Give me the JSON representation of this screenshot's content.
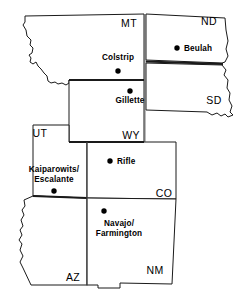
{
  "figure": {
    "name": "western-us-energy-sites-map",
    "type": "line-drawing-map",
    "background_color": "#ffffff",
    "line_color": "#1a1a1a",
    "width": 249,
    "height": 300
  },
  "states": [
    {
      "id": "MT",
      "abbr": "MT",
      "label_x": 129,
      "label_y": 27
    },
    {
      "id": "ND",
      "abbr": "ND",
      "label_x": 209,
      "label_y": 25
    },
    {
      "id": "SD",
      "abbr": "SD",
      "label_x": 214,
      "label_y": 104
    },
    {
      "id": "WY",
      "abbr": "WY",
      "label_x": 131,
      "label_y": 139
    },
    {
      "id": "UT",
      "abbr": "UT",
      "label_x": 40,
      "label_y": 137
    },
    {
      "id": "CO",
      "abbr": "CO",
      "label_x": 164,
      "label_y": 197
    },
    {
      "id": "AZ",
      "abbr": "AZ",
      "label_x": 73,
      "label_y": 281
    },
    {
      "id": "NM",
      "abbr": "NM",
      "label_x": 155,
      "label_y": 274
    }
  ],
  "sites": [
    {
      "id": "colstrip",
      "name": "Colstrip",
      "lines": [
        "Colstrip"
      ],
      "state": "MT",
      "dot_x": 118,
      "dot_y": 71,
      "label_x": 118,
      "label_y": 60,
      "label_anchor": "middle",
      "label_placement": "above"
    },
    {
      "id": "beulah",
      "name": "Beulah",
      "lines": [
        "Beulah"
      ],
      "state": "ND",
      "dot_x": 177,
      "dot_y": 48,
      "label_x": 184,
      "label_y": 51,
      "label_anchor": "start",
      "label_placement": "right"
    },
    {
      "id": "gillette",
      "name": "Gillette",
      "lines": [
        "Gillette"
      ],
      "state": "WY",
      "dot_x": 130,
      "dot_y": 91,
      "label_x": 130,
      "label_y": 103,
      "label_anchor": "middle",
      "label_placement": "below"
    },
    {
      "id": "kaiparowits-escalante",
      "name": "Kaiparowits/ Escalante",
      "lines": [
        "Kaiparowits/",
        "Escalante"
      ],
      "state": "UT",
      "dot_x": 54,
      "dot_y": 191,
      "label_x": 54,
      "label_y": 172,
      "label_anchor": "middle",
      "label_placement": "above"
    },
    {
      "id": "rifle",
      "name": "Rifle",
      "lines": [
        "Rifle"
      ],
      "state": "CO",
      "dot_x": 110,
      "dot_y": 161,
      "label_x": 117,
      "label_y": 164,
      "label_anchor": "start",
      "label_placement": "right"
    },
    {
      "id": "navajo-farmington",
      "name": "Navajo/ Farmington",
      "lines": [
        "Navajo/",
        "Farmington"
      ],
      "state": "NM",
      "dot_x": 104,
      "dot_y": 211,
      "label_x": 119,
      "label_y": 226,
      "label_anchor": "middle",
      "label_placement": "below"
    }
  ]
}
